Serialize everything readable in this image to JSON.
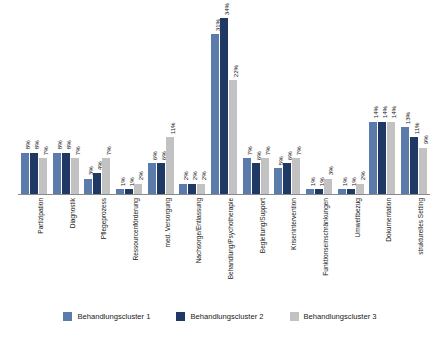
{
  "chart_data": {
    "type": "bar",
    "title": "",
    "subtitle": "",
    "xlabel": "",
    "ylabel": "",
    "ylim": [
      0,
      36
    ],
    "grid": false,
    "legend_position": "bottom",
    "value_suffix": "%",
    "categories": [
      "Partizipation",
      "Diagnostik",
      "Pflegeprozess",
      "Ressourcenförderung",
      "med. Versorgung",
      "Nachsorge/Entlassung",
      "Behandlung/Psychotherapie",
      "Begleitung/Support",
      "Krisenintervention",
      "Funktionseinschränkungen",
      "Umweltbezug",
      "Dokumentation",
      "strukturelles Setting"
    ],
    "series": [
      {
        "name": "Behandlungscluster 1",
        "color": "#5b7cab",
        "values": [
          8,
          8,
          3,
          1,
          6,
          2,
          31,
          7,
          5,
          1,
          1,
          14,
          13
        ],
        "labels": [
          "8%",
          "8%",
          "3%",
          "1%",
          "6%",
          "2%",
          "31%",
          "7%",
          "5%",
          "1%",
          "1%",
          "14%",
          "13%"
        ]
      },
      {
        "name": "Behandlungscluster 2",
        "color": "#1f3864",
        "values": [
          8,
          8,
          4,
          1,
          6,
          2,
          34,
          6,
          6,
          1,
          1,
          14,
          11
        ],
        "labels": [
          "8%",
          "8%",
          "4%",
          "1%",
          "6%",
          "2%",
          "34%",
          "6%",
          "6%",
          "1%",
          "1%",
          "14%",
          "11%"
        ]
      },
      {
        "name": "Behandlungscluster 3",
        "color": "#c2c2c2",
        "values": [
          7,
          7,
          7,
          2,
          11,
          2,
          22,
          7,
          7,
          3,
          2,
          14,
          9
        ],
        "labels": [
          "7%",
          "7%",
          "7%",
          "2%",
          "11%",
          "2%",
          "22%",
          "7%",
          "7%",
          "3%",
          "2%",
          "14%",
          "9%"
        ]
      }
    ]
  },
  "legend": {
    "items": [
      {
        "label": "Behandlungscluster 1",
        "color": "#5b7cab"
      },
      {
        "label": "Behandlungscluster 2",
        "color": "#1f3864"
      },
      {
        "label": "Behandlungscluster 3",
        "color": "#c2c2c2"
      }
    ]
  }
}
